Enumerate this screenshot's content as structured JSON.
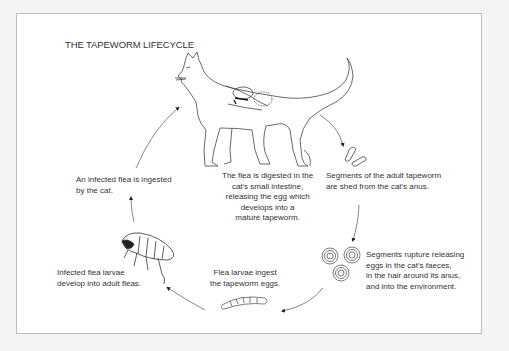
{
  "diagram": {
    "title": "THE TAPEWORM LIFECYCLE",
    "stages": [
      {
        "id": "cat-digestion",
        "lines": [
          "The flea is digested in the",
          "cat's small intestine,",
          "releasing the egg which",
          "develops into a",
          "mature tapeworm."
        ]
      },
      {
        "id": "segments-shed",
        "lines": [
          "Segments of the adult tapeworm",
          "are shed from the cat's anus."
        ]
      },
      {
        "id": "segments-rupture",
        "lines": [
          "Segments rupture releasing",
          "eggs in the cat's faeces,",
          "in the hair around its anus,",
          "and into the environment."
        ]
      },
      {
        "id": "larvae-ingest",
        "lines": [
          "Flea larvae ingest",
          "the tapeworm eggs."
        ]
      },
      {
        "id": "larvae-develop",
        "lines": [
          "Infected flea larvae",
          "develop into adult fleas."
        ]
      },
      {
        "id": "flea-ingested",
        "lines": [
          "An infected flea is ingested",
          "by the cat."
        ]
      }
    ],
    "illustrations": [
      "cat-icon",
      "tapeworm-segment-icon",
      "egg-cluster-icon",
      "flea-larva-icon",
      "adult-flea-icon"
    ],
    "colors": {
      "background": "#f4f4f4",
      "panel": "#ffffff",
      "ink": "#333333",
      "border": "#bdbdbd"
    }
  }
}
